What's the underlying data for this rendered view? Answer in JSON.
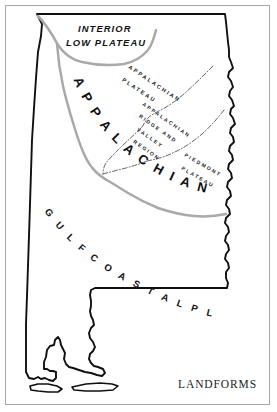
{
  "figure": {
    "title": "LANDFORMS",
    "frame_color": "#a6a6a6",
    "background_color": "#ffffff",
    "outline_color": "#101010",
    "province_boundary_color": "#a9a9a9",
    "subregion_boundary_color": "#3a3a3a"
  },
  "regions": {
    "interior_low_plateau": {
      "line1": "INTERIOR",
      "line2": "LOW PLATEAU"
    },
    "appalachian_highlands": {
      "label": "APPALACHIAN HIGHLANDS",
      "letters": [
        "A",
        "P",
        "P",
        "A",
        "L",
        "A",
        "C",
        "H",
        "I",
        "A",
        "N",
        "H",
        "I",
        "G",
        "H",
        "L",
        "A",
        "N",
        "D",
        "S"
      ]
    },
    "gulf_coastal_plain": {
      "label": "GULF COASTAL PLAIN",
      "letters": [
        "G",
        "U",
        "L",
        "F",
        "C",
        "O",
        "A",
        "S",
        "T",
        "A",
        "L",
        "P",
        "L",
        "A",
        "I",
        "N"
      ]
    },
    "appalachian_plateau": {
      "line1": "APPALACHIAN",
      "line2": "PLATEAU"
    },
    "appalachian_ridge_and_valley": {
      "line1": "APPALACHIAN",
      "line2": "RIDGE AND",
      "line3": "VALLEY",
      "line4": "REGION"
    },
    "piedmont_plateau": {
      "line1": "PIEDMONT",
      "line2": "PLATEAU"
    }
  },
  "features": {
    "mobile_bay": "Mobile Bay",
    "dauphin_island": "Dauphin Island",
    "chattahoochee_border": "Chattahoochee River border"
  }
}
